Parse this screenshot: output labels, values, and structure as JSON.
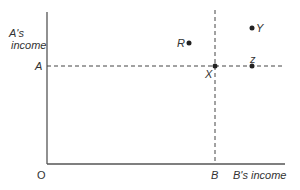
{
  "diagram": {
    "y_axis_label_line1": "A's",
    "y_axis_label_line2": "income",
    "x_axis_label": "B's income",
    "origin_label": "O",
    "y_tick_label": "A",
    "x_tick_label": "B",
    "points": [
      {
        "label": "R",
        "x": 189,
        "y": 43
      },
      {
        "label": "Y",
        "x": 252,
        "y": 28
      },
      {
        "label": "X",
        "x": 215,
        "y": 66
      },
      {
        "label": "z",
        "x": 252,
        "y": 66
      }
    ],
    "colors": {
      "axis": "#555555",
      "dash": "#444444",
      "point": "#222222"
    }
  }
}
